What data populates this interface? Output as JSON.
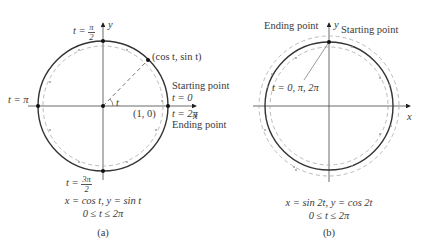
{
  "panel_a": {
    "y_axis_label": "y",
    "x_axis_label": "x",
    "top_label": "t = ",
    "top_frac_num": "π",
    "top_frac_den": "2",
    "bottom_label": "t = ",
    "bottom_frac_num": "3π",
    "bottom_frac_den": "2",
    "left_label": "t = π",
    "point_label": "(cos t, sin t)",
    "angle_label": "t",
    "origin_point_label": "(1, 0)",
    "start_label": "Starting point",
    "start_t": "t = 0",
    "end_t": "t = 2π",
    "end_label": "Ending point",
    "equation": "x = cos t, y = sin t",
    "range": "0 ≤ t ≤ 2π",
    "caption": "(a)"
  },
  "panel_b": {
    "y_axis_label": "y",
    "x_axis_label": "x",
    "end_label": "Ending point",
    "start_label": "Starting point",
    "t_values_label": "t = 0, π, 2π",
    "equation": "x = sin 2t, y = cos 2t",
    "range": "0 ≤ t ≤ 2π",
    "caption": "(b)"
  },
  "colors": {
    "circle": "#333333",
    "dashed": "#aaaaaa",
    "axis": "#444444"
  }
}
